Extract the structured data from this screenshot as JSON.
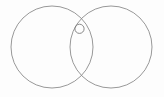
{
  "figure": {
    "description": "Line drawing of two large equal circles overlapping horizontally, forming a lens-shaped intersection region. A small circle is drawn just below the upper intersection point of the two large circles.",
    "background_color": "#fdfdfd",
    "stroke_color": "#8c8c8c",
    "stroke_color_small": "#7a7a7a",
    "stroke_width": 0.9,
    "canvas": {
      "width": 164,
      "height": 97
    }
  },
  "chart_data": {
    "type": "scatter",
    "xlabel": "",
    "ylabel": "",
    "xlim": [
      0,
      164
    ],
    "ylim": [
      0,
      97
    ],
    "grid": false,
    "legend": "none",
    "shapes": [
      {
        "name": "left-circle",
        "kind": "circle",
        "cx": 52,
        "cy": 47,
        "r": 41,
        "stroke": "#8c8c8c",
        "stroke_width": 0.9,
        "fill": "none"
      },
      {
        "name": "right-circle",
        "kind": "circle",
        "cx": 111,
        "cy": 47,
        "r": 41,
        "stroke": "#8c8c8c",
        "stroke_width": 0.9,
        "fill": "none"
      },
      {
        "name": "small-circle",
        "kind": "circle",
        "cx": 79.5,
        "cy": 28.8,
        "r": 4.6,
        "stroke": "#7a7a7a",
        "stroke_width": 0.9,
        "fill": "none"
      }
    ],
    "intersection_points": [
      {
        "name": "upper-intersection",
        "x": 81.5,
        "y": 23.5
      },
      {
        "name": "lower-intersection",
        "x": 81.5,
        "y": 70.5
      }
    ]
  },
  "labels": {
    "figure_caption": "",
    "left_circle_label": "",
    "right_circle_label": "",
    "small_circle_label": ""
  }
}
